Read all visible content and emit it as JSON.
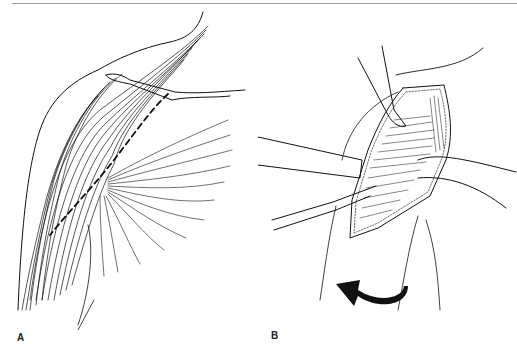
{
  "page": {
    "header_text_visible": false
  },
  "figure": {
    "panels": [
      {
        "label": "A",
        "description": "Shoulder musculature line drawing with dashed incision line along muscle fibers"
      },
      {
        "label": "B",
        "description": "Surgical exposure with retractors and rotation arrow"
      }
    ],
    "colors": {
      "ink": "#111111",
      "background": "#ffffff",
      "rule": "#9a9a9a"
    }
  }
}
